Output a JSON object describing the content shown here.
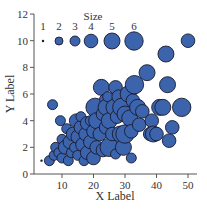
{
  "chart_data": {
    "type": "scatter",
    "title": "",
    "xlabel": "X Label",
    "ylabel": "Y Label",
    "xlim": [
      0,
      52
    ],
    "ylim": [
      0,
      12
    ],
    "xticks": [
      10,
      20,
      30,
      40,
      50
    ],
    "yticks": [
      0,
      2,
      4,
      6,
      8,
      10,
      12
    ],
    "grid": false,
    "colors": {
      "marker_fill": "#3b64ad",
      "marker_edge": "#1a1a2e",
      "axis": "#555555"
    },
    "legend": {
      "title": "Size",
      "position": "top-inside",
      "entries": [
        {
          "label": "1",
          "size": 1,
          "x": 4,
          "y": 10
        },
        {
          "label": "2",
          "size": 2,
          "x": 9,
          "y": 10
        },
        {
          "label": "3",
          "size": 3,
          "x": 14,
          "y": 10
        },
        {
          "label": "4",
          "size": 4,
          "x": 19,
          "y": 10
        },
        {
          "label": "5",
          "size": 5,
          "x": 26,
          "y": 10
        },
        {
          "label": "6",
          "size": 6,
          "x": 33,
          "y": 10
        }
      ]
    },
    "points": [
      {
        "x": 3.5,
        "y": 1.0,
        "size": 1
      },
      {
        "x": 6,
        "y": 1.0,
        "size": 3
      },
      {
        "x": 7,
        "y": 5.2,
        "size": 3
      },
      {
        "x": 7.5,
        "y": 1.4,
        "size": 3
      },
      {
        "x": 8,
        "y": 2.0,
        "size": 3
      },
      {
        "x": 9,
        "y": 1.6,
        "size": 3
      },
      {
        "x": 9.5,
        "y": 4.0,
        "size": 3
      },
      {
        "x": 10,
        "y": 1.2,
        "size": 3
      },
      {
        "x": 10,
        "y": 2.6,
        "size": 3
      },
      {
        "x": 11,
        "y": 2.0,
        "size": 4
      },
      {
        "x": 11.5,
        "y": 3.4,
        "size": 3
      },
      {
        "x": 12,
        "y": 1.0,
        "size": 3
      },
      {
        "x": 12.5,
        "y": 2.4,
        "size": 4
      },
      {
        "x": 13,
        "y": 1.6,
        "size": 3
      },
      {
        "x": 13.5,
        "y": 3.0,
        "size": 4
      },
      {
        "x": 14,
        "y": 2.0,
        "size": 3
      },
      {
        "x": 14.5,
        "y": 4.0,
        "size": 4
      },
      {
        "x": 15,
        "y": 1.4,
        "size": 3
      },
      {
        "x": 15,
        "y": 2.8,
        "size": 4
      },
      {
        "x": 16,
        "y": 3.5,
        "size": 4
      },
      {
        "x": 16,
        "y": 4.3,
        "size": 3
      },
      {
        "x": 16.5,
        "y": 2.2,
        "size": 4
      },
      {
        "x": 17,
        "y": 1.0,
        "size": 3
      },
      {
        "x": 17.5,
        "y": 3.0,
        "size": 4
      },
      {
        "x": 18,
        "y": 1.6,
        "size": 4
      },
      {
        "x": 18,
        "y": 3.8,
        "size": 4
      },
      {
        "x": 19,
        "y": 2.4,
        "size": 4
      },
      {
        "x": 19,
        "y": 4.0,
        "size": 3
      },
      {
        "x": 20,
        "y": 1.2,
        "size": 4
      },
      {
        "x": 20,
        "y": 3.2,
        "size": 4
      },
      {
        "x": 20.5,
        "y": 5.0,
        "size": 6
      },
      {
        "x": 21,
        "y": 2.0,
        "size": 4
      },
      {
        "x": 21,
        "y": 4.0,
        "size": 5
      },
      {
        "x": 22,
        "y": 3.0,
        "size": 4
      },
      {
        "x": 22.5,
        "y": 6.5,
        "size": 5
      },
      {
        "x": 23,
        "y": 1.8,
        "size": 4
      },
      {
        "x": 23,
        "y": 4.5,
        "size": 4
      },
      {
        "x": 23.5,
        "y": 5.6,
        "size": 3
      },
      {
        "x": 24,
        "y": 3.5,
        "size": 4
      },
      {
        "x": 24,
        "y": 5.0,
        "size": 5
      },
      {
        "x": 24.5,
        "y": 5.8,
        "size": 3
      },
      {
        "x": 25,
        "y": 2.0,
        "size": 6
      },
      {
        "x": 25,
        "y": 4.0,
        "size": 5
      },
      {
        "x": 26,
        "y": 3.0,
        "size": 4
      },
      {
        "x": 26.5,
        "y": 5.0,
        "size": 5
      },
      {
        "x": 27,
        "y": 1.5,
        "size": 3
      },
      {
        "x": 27,
        "y": 6.5,
        "size": 4
      },
      {
        "x": 27.5,
        "y": 4.3,
        "size": 4
      },
      {
        "x": 28,
        "y": 5.8,
        "size": 4
      },
      {
        "x": 28.5,
        "y": 3.0,
        "size": 5
      },
      {
        "x": 29,
        "y": 5.0,
        "size": 6
      },
      {
        "x": 29.5,
        "y": 2.0,
        "size": 5
      },
      {
        "x": 30,
        "y": 3.0,
        "size": 6
      },
      {
        "x": 30,
        "y": 4.5,
        "size": 5
      },
      {
        "x": 31,
        "y": 6.0,
        "size": 5
      },
      {
        "x": 31.5,
        "y": 4.2,
        "size": 5
      },
      {
        "x": 32,
        "y": 1.2,
        "size": 3
      },
      {
        "x": 32,
        "y": 3.2,
        "size": 4
      },
      {
        "x": 32.5,
        "y": 5.5,
        "size": 4
      },
      {
        "x": 33,
        "y": 6.7,
        "size": 6
      },
      {
        "x": 34,
        "y": 5.0,
        "size": 5
      },
      {
        "x": 34.5,
        "y": 3.7,
        "size": 4
      },
      {
        "x": 35.5,
        "y": 4.7,
        "size": 4
      },
      {
        "x": 37,
        "y": 7.6,
        "size": 5
      },
      {
        "x": 38,
        "y": 3.0,
        "size": 4
      },
      {
        "x": 38.5,
        "y": 4.0,
        "size": 4
      },
      {
        "x": 39,
        "y": 3.0,
        "size": 5
      },
      {
        "x": 40,
        "y": 3.0,
        "size": 4
      },
      {
        "x": 41,
        "y": 5.0,
        "size": 5
      },
      {
        "x": 42,
        "y": 5.0,
        "size": 5
      },
      {
        "x": 43,
        "y": 9.0,
        "size": 5
      },
      {
        "x": 43.5,
        "y": 6.7,
        "size": 5
      },
      {
        "x": 44,
        "y": 2.5,
        "size": 4
      },
      {
        "x": 45,
        "y": 3.5,
        "size": 4
      },
      {
        "x": 48,
        "y": 5.0,
        "size": 6
      },
      {
        "x": 50,
        "y": 10.0,
        "size": 4
      }
    ]
  }
}
